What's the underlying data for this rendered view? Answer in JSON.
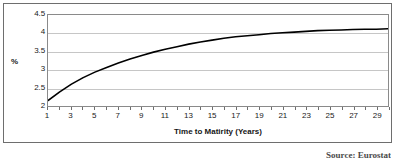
{
  "figure": {
    "source_note": "Source: Eurostat",
    "frame_color": "#6e6e6e",
    "plot_border_color": "#8a8a8a",
    "gridline_color": "#c6c6c6",
    "line_color": "#000000",
    "background": "#ffffff"
  },
  "chart_data": {
    "type": "line",
    "title": "",
    "xlabel": "Time to Matirity (Years)",
    "ylabel": "%",
    "xlim": [
      1,
      30
    ],
    "ylim": [
      2,
      4.5
    ],
    "grid": true,
    "legend": null,
    "ytick_labels": [
      "4.5",
      "4",
      "3.5",
      "3",
      "2.5",
      "2"
    ],
    "ytick_values": [
      4.5,
      4,
      3.5,
      3,
      2.5,
      2
    ],
    "xtick_labels": [
      "1",
      "3",
      "5",
      "7",
      "9",
      "11",
      "13",
      "15",
      "17",
      "19",
      "21",
      "23",
      "25",
      "27",
      "29"
    ],
    "xtick_values": [
      1,
      3,
      5,
      7,
      9,
      11,
      13,
      15,
      17,
      19,
      21,
      23,
      25,
      27,
      29
    ],
    "x": [
      1,
      2,
      3,
      4,
      5,
      6,
      7,
      8,
      9,
      10,
      11,
      12,
      13,
      14,
      15,
      16,
      17,
      18,
      19,
      20,
      21,
      22,
      23,
      24,
      25,
      26,
      27,
      28,
      29,
      30
    ],
    "values": [
      2.15,
      2.39,
      2.6,
      2.78,
      2.93,
      3.06,
      3.18,
      3.29,
      3.39,
      3.48,
      3.56,
      3.63,
      3.7,
      3.76,
      3.81,
      3.86,
      3.9,
      3.93,
      3.96,
      3.99,
      4.01,
      4.03,
      4.05,
      4.07,
      4.08,
      4.09,
      4.1,
      4.11,
      4.11,
      4.12
    ],
    "series": [
      {
        "name": "Euro area yield curve",
        "values": [
          2.15,
          2.39,
          2.6,
          2.78,
          2.93,
          3.06,
          3.18,
          3.29,
          3.39,
          3.48,
          3.56,
          3.63,
          3.7,
          3.76,
          3.81,
          3.86,
          3.9,
          3.93,
          3.96,
          3.99,
          4.01,
          4.03,
          4.05,
          4.07,
          4.08,
          4.09,
          4.1,
          4.11,
          4.11,
          4.12
        ]
      }
    ]
  }
}
